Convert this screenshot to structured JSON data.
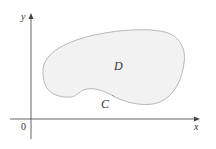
{
  "figure": {
    "axes": {
      "x_label": "x",
      "y_label": "y",
      "origin_label": "0"
    },
    "region": {
      "label": "D",
      "fill_color": "#f2f2f2",
      "stroke_color": "#b8b8b8"
    },
    "boundary_curve": {
      "label": "C"
    },
    "colors": {
      "axis": "#555555",
      "text": "#333333",
      "background": "#ffffff"
    }
  }
}
